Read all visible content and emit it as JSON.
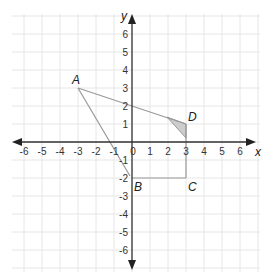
{
  "diagram": {
    "type": "coordinate-plane",
    "x_axis": {
      "label": "x",
      "min": -6,
      "max": 6,
      "ticks": [
        "-6",
        "-5",
        "-4",
        "-3",
        "-2",
        "-1",
        "0",
        "1",
        "2",
        "3",
        "4",
        "5",
        "6"
      ]
    },
    "y_axis": {
      "label": "y",
      "min": -6,
      "max": 6,
      "ticks": [
        "6",
        "5",
        "4",
        "3",
        "2",
        "1",
        "-1",
        "-2",
        "-3",
        "-4",
        "-5",
        "-6"
      ]
    },
    "points": {
      "A": {
        "label": "A",
        "x": -3,
        "y": 3
      },
      "B": {
        "label": "B",
        "x": 0,
        "y": -2
      },
      "C": {
        "label": "C",
        "x": 3,
        "y": -2
      },
      "D": {
        "label": "D",
        "x": 3,
        "y": 1
      }
    },
    "segments": [
      [
        "A",
        "D"
      ],
      [
        "A",
        "B"
      ],
      [
        "B",
        "C"
      ],
      [
        "C",
        "D"
      ]
    ],
    "shaded_region": "small triangle near D",
    "colors": {
      "grid": "#e6e6e6",
      "axis": "#333333",
      "shape": "#aaaaaa",
      "shade": "#cccccc"
    }
  }
}
